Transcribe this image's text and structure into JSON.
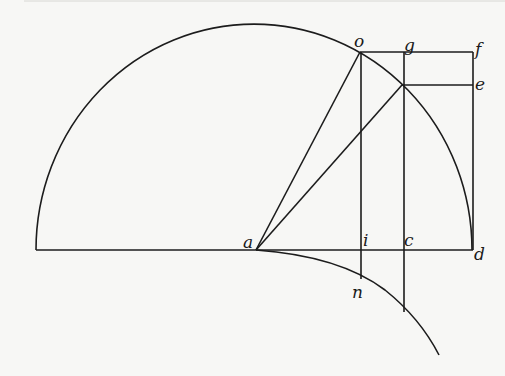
{
  "diagram": {
    "type": "geometric construction",
    "stroke_color": "#1c1c1c",
    "background_color": "#f7f7f5",
    "labels": {
      "o": "o",
      "g": "g",
      "f": "f",
      "e": "e",
      "a": "a",
      "i": "i",
      "c": "c",
      "d": "d",
      "n": "n"
    },
    "points": {
      "a": [
        256,
        250
      ],
      "o": [
        360,
        52
      ],
      "g": [
        402,
        52
      ],
      "f": [
        473,
        52
      ],
      "e": [
        473,
        85
      ],
      "p": [
        402,
        85
      ],
      "i": [
        361,
        250
      ],
      "c": [
        404,
        250
      ],
      "d": [
        473,
        250
      ],
      "n": [
        361,
        278
      ],
      "q": [
        404,
        312
      ]
    },
    "elements": [
      "semicircle from left end to d with center near a",
      "baseline from left end to d",
      "segment a-o",
      "segment a-p (intersection on arc)",
      "vertical o-i-n",
      "vertical g-c extended to lower curve",
      "rectangle o-f-d with horizontal p-e",
      "lower curve starting at a descending right"
    ]
  }
}
